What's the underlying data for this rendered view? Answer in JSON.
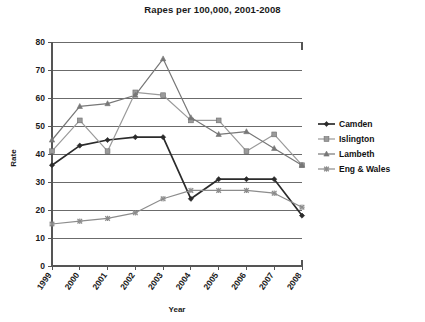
{
  "chart_data": {
    "type": "line",
    "title": "Rapes per 100,000, 2001-2008",
    "xlabel": "Year",
    "ylabel": "Rate",
    "categories": [
      "1999",
      "2000",
      "2001",
      "2002",
      "2003",
      "2004",
      "2005",
      "2006",
      "2007",
      "2008"
    ],
    "ylim": [
      0,
      80
    ],
    "yticks": [
      "0",
      "10",
      "20",
      "30",
      "40",
      "50",
      "60",
      "70",
      "80"
    ],
    "grid": true,
    "legend_position": "right",
    "series": [
      {
        "name": "Camden",
        "marker": "diamond",
        "color": "#2b2b2b",
        "values": [
          36,
          43,
          45,
          46,
          46,
          24,
          31,
          31,
          31,
          18
        ]
      },
      {
        "name": "Islington",
        "marker": "square",
        "color": "#9a9a9a",
        "values": [
          41,
          52,
          41,
          62,
          61,
          52,
          52,
          41,
          47,
          36
        ]
      },
      {
        "name": "Lambeth",
        "marker": "triangle",
        "color": "#777777",
        "values": [
          45,
          57,
          58,
          61,
          74,
          53,
          47,
          48,
          42,
          36
        ]
      },
      {
        "name": "Eng & Wales",
        "marker": "cross",
        "color": "#8c8c8c",
        "values": [
          15,
          16,
          17,
          19,
          24,
          27,
          27,
          27,
          26,
          21
        ]
      }
    ]
  },
  "legend": {
    "items": [
      {
        "label": "Camden"
      },
      {
        "label": "Islington"
      },
      {
        "label": "Lambeth"
      },
      {
        "label": "Eng & Wales"
      }
    ]
  }
}
